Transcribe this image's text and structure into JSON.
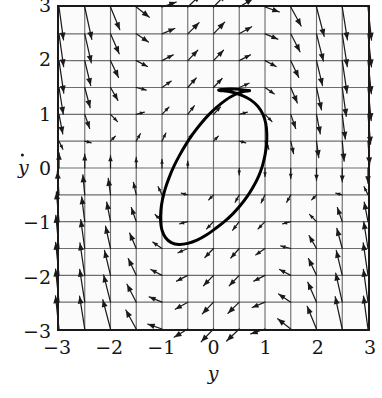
{
  "figure": {
    "kind": "phase-portrait",
    "background_color": "#ffffff",
    "plot_background_color": "#fbfbfb",
    "frame_color": "#1a1a1a",
    "grid_color": "#6e6e6e",
    "arrow_color": "#1a1a1a",
    "curve_color": "#000000"
  },
  "axes": {
    "x_title": "y",
    "y_title": "y",
    "y_title_has_dot": true,
    "x_ticks": [
      "−3",
      "−2",
      "−1",
      "0",
      "1",
      "2",
      "3"
    ],
    "y_ticks": [
      "3",
      "2",
      "1",
      "0",
      "−1",
      "−2",
      "−3"
    ],
    "x_tick_values": [
      -3,
      -2,
      -1,
      0,
      1,
      2,
      3
    ],
    "y_tick_values": [
      3,
      2,
      1,
      0,
      -1,
      -2,
      -3
    ],
    "xlim": [
      -3,
      3
    ],
    "ylim": [
      -3,
      3
    ],
    "grid": true,
    "grid_step": 0.5
  },
  "chart_data": {
    "type": "scatter",
    "title": "",
    "subtitle": "",
    "xlabel": "y",
    "ylabel": "ydot",
    "xlim": [
      -3,
      3
    ],
    "ylim": [
      -3,
      3
    ],
    "grid": true,
    "grid_step": 0.5,
    "legend": [],
    "vector_field": {
      "model": "vanderpol-like",
      "equations": {
        "dy_dt": "ydot",
        "dydot_dt": "mu*(1 - y*y)*ydot - y"
      },
      "mu": 1.0,
      "sample_step": 0.5,
      "sample_range": [
        -3,
        3
      ],
      "arrow_count_x": 13,
      "arrow_count_y": 13,
      "arrow_scale": 0.16,
      "arrow_max_length_units": 0.62
    },
    "limit_cycle": {
      "label": "limit cycle",
      "closed": true,
      "center": [
        0.0,
        0.02
      ],
      "x_extent": [
        -1.02,
        1.03
      ],
      "y_extent": [
        -1.42,
        1.45
      ],
      "points": [
        [
          0.1,
          1.45
        ],
        [
          0.33,
          1.42
        ],
        [
          0.54,
          1.36
        ],
        [
          0.72,
          1.27
        ],
        [
          0.86,
          1.15
        ],
        [
          0.96,
          1.0
        ],
        [
          1.015,
          0.83
        ],
        [
          1.035,
          0.64
        ],
        [
          1.03,
          0.44
        ],
        [
          1.0,
          0.24
        ],
        [
          0.95,
          0.04
        ],
        [
          0.875,
          -0.155
        ],
        [
          0.775,
          -0.345
        ],
        [
          0.655,
          -0.53
        ],
        [
          0.52,
          -0.7
        ],
        [
          0.37,
          -0.86
        ],
        [
          0.205,
          -1.005
        ],
        [
          0.035,
          -1.13
        ],
        [
          -0.14,
          -1.25
        ],
        [
          -0.32,
          -1.345
        ],
        [
          -0.5,
          -1.405
        ],
        [
          -0.67,
          -1.425
        ],
        [
          -0.82,
          -1.39
        ],
        [
          -0.93,
          -1.3
        ],
        [
          -1.0,
          -1.16
        ],
        [
          -1.028,
          -0.985
        ],
        [
          -1.022,
          -0.79
        ],
        [
          -0.99,
          -0.585
        ],
        [
          -0.935,
          -0.38
        ],
        [
          -0.86,
          -0.175
        ],
        [
          -0.77,
          0.03
        ],
        [
          -0.66,
          0.235
        ],
        [
          -0.535,
          0.44
        ],
        [
          -0.4,
          0.635
        ],
        [
          -0.255,
          0.815
        ],
        [
          -0.1,
          0.985
        ],
        [
          0.065,
          1.135
        ],
        [
          0.235,
          1.265
        ],
        [
          0.4,
          1.36
        ],
        [
          0.56,
          1.42
        ],
        [
          0.7,
          1.44
        ],
        [
          0.62,
          1.45
        ],
        [
          0.43,
          1.47
        ],
        [
          0.25,
          1.47
        ]
      ]
    }
  }
}
